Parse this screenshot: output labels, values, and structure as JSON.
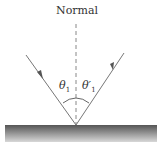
{
  "diagram": {
    "labels": {
      "normal": "Normal",
      "incident_angle": "θ",
      "incident_angle_sub": "1",
      "reflected_angle": "θ′",
      "reflected_angle_sub": "1"
    },
    "colors": {
      "ray": "#777777",
      "normal_line": "#888888",
      "surface_top": "#555555",
      "surface_bottom": "#d0d0d0"
    }
  }
}
